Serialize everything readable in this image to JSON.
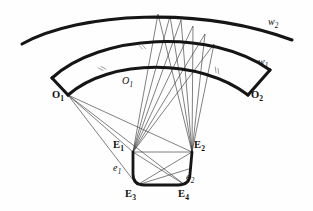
{
  "figure": {
    "background_color": "#fefefe",
    "stroke_color": "#151515",
    "thin_ray_color": "#3a3a3a",
    "hatch_color": "#8d8d8d",
    "width": 313,
    "height": 211
  },
  "labels": {
    "w2": {
      "base": "w",
      "sub": "2",
      "x": 268,
      "y": 17,
      "style": "italic"
    },
    "w1": {
      "base": "w",
      "sub": "1",
      "x": 258,
      "y": 57,
      "style": "italic"
    },
    "O1_arc": {
      "base": "O",
      "sub": "1",
      "x": 122,
      "y": 76,
      "style": "italic"
    },
    "O1_vertex": {
      "base": "O",
      "sub": "1",
      "x": 52,
      "y": 90,
      "style": "bold"
    },
    "O2_vertex": {
      "base": "O",
      "sub": "2",
      "x": 251,
      "y": 90,
      "style": "bold"
    },
    "E1": {
      "base": "E",
      "sub": "1",
      "x": 113,
      "y": 140,
      "style": "bold"
    },
    "E2": {
      "base": "E",
      "sub": "2",
      "x": 194,
      "y": 140,
      "style": "bold"
    },
    "E3": {
      "base": "E",
      "sub": "3",
      "x": 125,
      "y": 189,
      "style": "bold"
    },
    "E4": {
      "base": "E",
      "sub": "4",
      "x": 178,
      "y": 189,
      "style": "bold"
    },
    "e1": {
      "base": "e",
      "sub": "1",
      "x": 113,
      "y": 163,
      "style": "italic"
    },
    "e2": {
      "base": "e",
      "sub": "2",
      "x": 186,
      "y": 172,
      "style": "italic"
    }
  },
  "geometry": {
    "arc_w2": "M 22,44 C 80,12 200,6 292,40",
    "arc_w1": "M 52,78 C 100,34 210,28 270,70",
    "arc_O1O2": "M 68,95 C 110,58 200,58 248,95",
    "vertices": {
      "O1": {
        "x": 68,
        "y": 95
      },
      "O2": {
        "x": 248,
        "y": 95
      },
      "E1": {
        "x": 133,
        "y": 152
      },
      "E2": {
        "x": 192,
        "y": 152
      },
      "E3": {
        "x": 137,
        "y": 185
      },
      "E4": {
        "x": 185,
        "y": 185
      },
      "apex": {
        "x": 158,
        "y": 14
      }
    },
    "quad_path": "M 133,152 L 133,174 Q 133,185 144,185 L 178,185 Q 190,185 190,174 L 192,152",
    "quad_top_edge": "M 133,152 L 192,152",
    "fan_O1_targets": [
      {
        "x": 133,
        "y": 152
      },
      {
        "x": 137,
        "y": 185
      },
      {
        "x": 185,
        "y": 185
      },
      {
        "x": 192,
        "y": 152
      }
    ],
    "fan_E1_upper": [
      {
        "x": 158,
        "y": 14
      },
      {
        "x": 170,
        "y": 16
      },
      {
        "x": 181,
        "y": 20
      },
      {
        "x": 193,
        "y": 26
      },
      {
        "x": 205,
        "y": 34
      },
      {
        "x": 214,
        "y": 44
      }
    ],
    "fan_E2_upper": [
      {
        "x": 158,
        "y": 14
      },
      {
        "x": 170,
        "y": 16
      },
      {
        "x": 181,
        "y": 20
      },
      {
        "x": 193,
        "y": 26
      },
      {
        "x": 205,
        "y": 34
      },
      {
        "x": 214,
        "y": 44
      }
    ],
    "internal_chords": [
      {
        "from": "E1",
        "to": "E4"
      },
      {
        "from": "E2",
        "to": "E3"
      },
      {
        "from": "E1",
        "to": "E2"
      },
      {
        "from": "E3",
        "to": "E2"
      }
    ],
    "hatch_marks": [
      {
        "x": 101,
        "y": 69,
        "angle": -28
      },
      {
        "x": 141,
        "y": 47,
        "angle": -8
      },
      {
        "x": 216,
        "y": 70,
        "angle": 26
      }
    ]
  }
}
